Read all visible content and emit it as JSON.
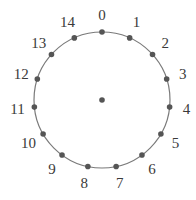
{
  "diagram": {
    "type": "circular-node-ring",
    "center": {
      "x": 102,
      "y": 100
    },
    "radius": 68,
    "label_radius": 85,
    "node_count": 15,
    "has_center_node": true,
    "colors": {
      "circle_stroke": "#7a7a7a",
      "node_fill": "#555555",
      "label": "#3a3a3a",
      "background": "#ffffff"
    },
    "nodes": [
      {
        "label": "0"
      },
      {
        "label": "1"
      },
      {
        "label": "2"
      },
      {
        "label": "3"
      },
      {
        "label": "4"
      },
      {
        "label": "5"
      },
      {
        "label": "6"
      },
      {
        "label": "7"
      },
      {
        "label": "8"
      },
      {
        "label": "9"
      },
      {
        "label": "10"
      },
      {
        "label": "11"
      },
      {
        "label": "12"
      },
      {
        "label": "13"
      },
      {
        "label": "14"
      }
    ]
  }
}
